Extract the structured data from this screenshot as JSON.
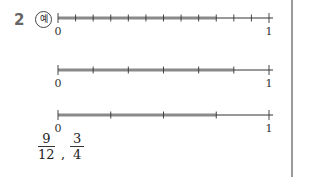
{
  "problem": {
    "number": "2",
    "example_mark": "예"
  },
  "number_lines": [
    {
      "start_label": "0",
      "end_label": "1",
      "segments": 12,
      "shaded": 9
    },
    {
      "start_label": "0",
      "end_label": "1",
      "segments": 6,
      "shaded": 5
    },
    {
      "start_label": "0",
      "end_label": "1",
      "segments": 4,
      "shaded": 3
    }
  ],
  "answer": {
    "fractions": [
      {
        "numerator": "9",
        "denominator": "12"
      },
      {
        "numerator": "3",
        "denominator": "4"
      }
    ],
    "separator": ","
  },
  "colors": {
    "shade": "#8a8a8a",
    "line": "#333333"
  }
}
